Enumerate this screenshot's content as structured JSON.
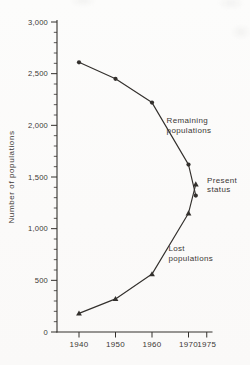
{
  "figure": {
    "colors": {
      "ink_text": "#3b3835",
      "ink_line": "#33302d",
      "paper": "#fbfaf9"
    }
  },
  "chart_data": {
    "type": "line",
    "title": "",
    "xlabel": "",
    "ylabel": "Number of populations",
    "xlim": [
      1934,
      1977
    ],
    "ylim": [
      0,
      3000
    ],
    "grid": false,
    "legend": "none",
    "x_ticks": [
      1940,
      1950,
      1960,
      1970,
      1975
    ],
    "x_tick_labels": [
      "1940",
      "1950",
      "1960",
      "1970",
      "1975"
    ],
    "y_ticks": [
      0,
      500,
      1000,
      1500,
      2000,
      2500,
      3000
    ],
    "y_tick_labels": [
      "0",
      "500",
      "1,000",
      "1,500",
      "2,000",
      "2,500",
      "3,000"
    ],
    "y_minor_step": 100,
    "series": [
      {
        "name": "Remaining populations",
        "marker": "circle",
        "x": [
          1940,
          1950,
          1960,
          1970,
          1972
        ],
        "values": [
          2610,
          2450,
          2220,
          1620,
          1320
        ]
      },
      {
        "name": "Lost populations",
        "marker": "triangle",
        "x": [
          1940,
          1950,
          1960,
          1970,
          1972
        ],
        "values": [
          180,
          320,
          560,
          1150,
          1430
        ]
      }
    ],
    "annotations": [
      {
        "name": "remaining-populations-label",
        "lines": [
          "Remaining",
          "populations"
        ],
        "year": 1964,
        "value": 2100
      },
      {
        "name": "present-status-label",
        "lines": [
          "Present",
          "status"
        ],
        "year": 1975.1,
        "value": 1520
      },
      {
        "name": "lost-populations-label",
        "lines": [
          "Lost",
          "populations"
        ],
        "year": 1964.5,
        "value": 860
      }
    ]
  }
}
